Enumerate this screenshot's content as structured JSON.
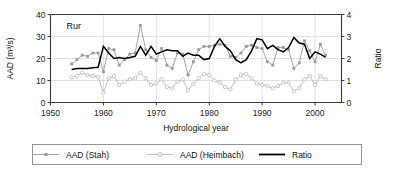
{
  "chart_data": {
    "type": "line",
    "title": "",
    "annotation": "Rur",
    "xlabel": "Hydrological year",
    "ylabel": "AAD (m³/s)",
    "y2label": "Ratio",
    "xlim": [
      1950,
      2005
    ],
    "ylim": [
      0,
      40
    ],
    "y2lim": [
      0,
      4
    ],
    "xticks": [
      1950,
      1960,
      1970,
      1980,
      1990,
      2000
    ],
    "xticklabels": [
      "1950",
      "1960",
      "1970",
      "1980",
      "1990",
      "2000"
    ],
    "yticks": [
      0,
      10,
      20,
      30,
      40
    ],
    "yticklabels": [
      "0",
      "10",
      "20",
      "30",
      "40"
    ],
    "y2ticks": [
      0,
      1,
      2,
      3,
      4
    ],
    "y2ticklabels": [
      "0",
      "1",
      "2",
      "3",
      "4"
    ],
    "grid": true,
    "legend_position": "below",
    "series": [
      {
        "name": "AAD (Stah)",
        "axis": "left",
        "color": "#9a9a9a",
        "marker": "square-filled",
        "x": [
          1954,
          1955,
          1956,
          1957,
          1958,
          1959,
          1960,
          1961,
          1962,
          1963,
          1964,
          1965,
          1966,
          1967,
          1968,
          1969,
          1970,
          1971,
          1972,
          1973,
          1974,
          1975,
          1976,
          1977,
          1978,
          1979,
          1980,
          1981,
          1982,
          1983,
          1984,
          1985,
          1986,
          1987,
          1988,
          1989,
          1990,
          1991,
          1992,
          1993,
          1994,
          1995,
          1996,
          1997,
          1998,
          1999,
          2000,
          2001,
          2002
        ],
        "values": [
          17.5,
          19.5,
          21.5,
          21.0,
          22.5,
          22.5,
          14.0,
          24.5,
          24.0,
          17.0,
          19.5,
          22.0,
          22.5,
          35.0,
          24.0,
          20.5,
          19.0,
          24.5,
          17.0,
          15.5,
          22.5,
          22.0,
          12.5,
          18.5,
          24.0,
          25.5,
          25.5,
          26.0,
          26.5,
          26.0,
          21.0,
          20.5,
          22.5,
          25.5,
          26.0,
          25.0,
          24.5,
          18.5,
          17.0,
          25.0,
          25.0,
          24.0,
          15.5,
          18.0,
          28.0,
          23.5,
          18.5,
          26.5,
          21.5
        ]
      },
      {
        "name": "AAD (Heimbach)",
        "axis": "left",
        "color": "#b9b9b9",
        "marker": "circle-open",
        "x": [
          1954,
          1955,
          1956,
          1957,
          1958,
          1959,
          1960,
          1961,
          1962,
          1963,
          1964,
          1965,
          1966,
          1967,
          1968,
          1969,
          1970,
          1971,
          1972,
          1973,
          1974,
          1975,
          1976,
          1977,
          1978,
          1979,
          1980,
          1981,
          1982,
          1983,
          1984,
          1985,
          1986,
          1987,
          1988,
          1989,
          1990,
          1991,
          1992,
          1993,
          1994,
          1995,
          1996,
          1997,
          1998,
          1999,
          2000,
          2001,
          2002
        ],
        "values": [
          11.5,
          12.0,
          13.5,
          12.5,
          12.0,
          11.5,
          4.5,
          11.0,
          12.0,
          8.0,
          9.5,
          10.5,
          11.0,
          13.5,
          11.0,
          8.0,
          8.5,
          10.5,
          7.0,
          6.5,
          9.5,
          10.5,
          5.5,
          8.5,
          11.0,
          13.0,
          12.5,
          10.0,
          9.0,
          7.0,
          6.0,
          10.5,
          12.5,
          13.0,
          11.0,
          8.5,
          8.0,
          7.5,
          6.5,
          7.5,
          9.0,
          9.0,
          5.0,
          6.5,
          10.5,
          12.0,
          8.0,
          12.0,
          10.5
        ]
      },
      {
        "name": "Ratio",
        "axis": "right",
        "color": "#000000",
        "marker": "none",
        "x": [
          1954,
          1955,
          1956,
          1957,
          1958,
          1959,
          1960,
          1961,
          1962,
          1963,
          1964,
          1965,
          1966,
          1967,
          1968,
          1969,
          1970,
          1971,
          1972,
          1973,
          1974,
          1975,
          1976,
          1977,
          1978,
          1979,
          1980,
          1981,
          1982,
          1983,
          1984,
          1985,
          1986,
          1987,
          1988,
          1989,
          1990,
          1991,
          1992,
          1993,
          1994,
          1995,
          1996,
          1997,
          1998,
          1999,
          2000,
          2001,
          2002
        ],
        "values": [
          1.5,
          1.55,
          1.55,
          1.55,
          1.58,
          1.6,
          2.55,
          2.25,
          2.0,
          2.05,
          2.0,
          2.05,
          2.1,
          2.55,
          2.15,
          2.55,
          2.2,
          2.3,
          2.4,
          2.35,
          2.35,
          2.1,
          2.25,
          2.15,
          2.15,
          1.95,
          2.0,
          2.55,
          2.9,
          2.55,
          2.35,
          1.95,
          1.8,
          1.95,
          2.35,
          2.9,
          2.85,
          2.45,
          2.6,
          2.4,
          2.3,
          2.5,
          2.95,
          2.7,
          2.65,
          2.0,
          2.3,
          2.2,
          2.05
        ]
      }
    ],
    "legend": [
      {
        "label": "AAD (Stah)",
        "marker": "square-filled",
        "color": "#9a9a9a"
      },
      {
        "label": "AAD (Heimbach)",
        "marker": "circle-open",
        "color": "#b9b9b9"
      },
      {
        "label": "Ratio",
        "marker": "none",
        "color": "#000000"
      }
    ]
  }
}
